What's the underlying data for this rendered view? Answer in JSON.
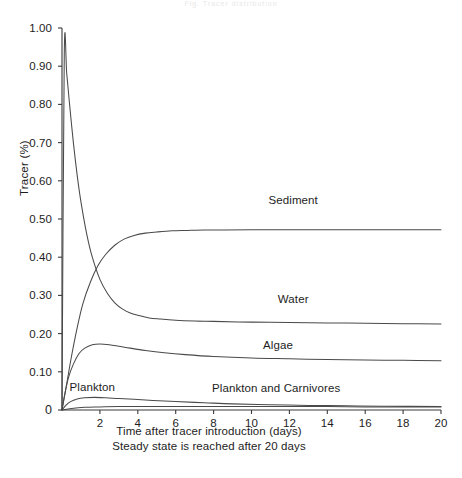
{
  "figure": {
    "top_faint_text": "Fig.   Tracer  distribution",
    "y_axis_title": "Tracer (%)",
    "x_caption_line1": "Time after tracer introduction (days)",
    "x_caption_line2": "Steady state is reached after 20 days"
  },
  "chart_data": {
    "type": "line",
    "title": "",
    "xlabel": "Time after tracer introduction (days)",
    "ylabel": "Tracer (%)",
    "xlim": [
      0,
      20
    ],
    "ylim": [
      0,
      1.0
    ],
    "grid": false,
    "legend": "inline-labels",
    "xticks": [
      0,
      2,
      4,
      6,
      8,
      10,
      12,
      14,
      16,
      18,
      20
    ],
    "xtick_labels": [
      "0",
      "2",
      "4",
      "6",
      "8",
      "10",
      "12",
      "14",
      "16",
      "18",
      "20"
    ],
    "yticks": [
      0,
      0.1,
      0.2,
      0.3,
      0.4,
      0.5,
      0.6,
      0.7,
      0.8,
      0.9,
      1.0
    ],
    "ytick_labels": [
      "0",
      "0.10",
      "0.20",
      "0.30",
      "0.40",
      "0.50",
      "0.60",
      "0.70",
      "0.80",
      "0.90",
      "1.00"
    ],
    "annotations": [
      {
        "text": "Sediment",
        "x": 12.2,
        "y": 0.545
      },
      {
        "text": "Water",
        "x": 12.2,
        "y": 0.285
      },
      {
        "text": "Algae",
        "x": 11.4,
        "y": 0.165
      },
      {
        "text": "Plankton",
        "x": 1.6,
        "y": 0.055
      },
      {
        "text": "Plankton and Carnivores",
        "x": 11.3,
        "y": 0.052
      }
    ],
    "series": [
      {
        "name": "Water",
        "color": "#4a4a4a",
        "x": [
          0,
          0.12,
          0.25,
          0.4,
          0.6,
          0.8,
          1.0,
          1.3,
          1.6,
          2.0,
          2.4,
          2.8,
          3.2,
          3.6,
          4.0,
          4.6,
          5.2,
          6.0,
          7.0,
          8.0,
          10.0,
          12.0,
          14.0,
          16.0,
          18.0,
          20.0
        ],
        "y": [
          0.0,
          0.93,
          0.88,
          0.8,
          0.7,
          0.615,
          0.545,
          0.462,
          0.4,
          0.342,
          0.305,
          0.28,
          0.264,
          0.254,
          0.248,
          0.241,
          0.238,
          0.235,
          0.233,
          0.232,
          0.23,
          0.229,
          0.228,
          0.227,
          0.226,
          0.225
        ]
      },
      {
        "name": "Sediment",
        "color": "#4a4a4a",
        "x": [
          0,
          0.2,
          0.5,
          0.8,
          1.1,
          1.5,
          1.9,
          2.3,
          2.8,
          3.3,
          3.8,
          4.4,
          5.0,
          5.8,
          6.6,
          7.5,
          8.5,
          10.0,
          12.0,
          14.0,
          16.0,
          18.0,
          20.0
        ],
        "y": [
          0.0,
          0.055,
          0.14,
          0.215,
          0.278,
          0.335,
          0.378,
          0.407,
          0.432,
          0.448,
          0.457,
          0.463,
          0.466,
          0.469,
          0.47,
          0.471,
          0.471,
          0.472,
          0.472,
          0.472,
          0.472,
          0.472,
          0.472
        ]
      },
      {
        "name": "Algae",
        "color": "#4a4a4a",
        "x": [
          0,
          0.15,
          0.35,
          0.6,
          0.9,
          1.2,
          1.6,
          2.0,
          2.5,
          3.0,
          3.6,
          4.4,
          5.4,
          6.5,
          8.0,
          10.0,
          12.0,
          14.0,
          16.0,
          18.0,
          20.0
        ],
        "y": [
          0.0,
          0.042,
          0.086,
          0.12,
          0.148,
          0.162,
          0.171,
          0.173,
          0.171,
          0.167,
          0.162,
          0.156,
          0.15,
          0.145,
          0.14,
          0.136,
          0.134,
          0.132,
          0.131,
          0.13,
          0.129
        ]
      },
      {
        "name": "Plankton",
        "color": "#4a4a4a",
        "x": [
          0,
          0.2,
          0.45,
          0.8,
          1.2,
          1.7,
          2.3,
          3.0,
          3.8,
          4.8,
          6.0,
          7.5,
          9.0,
          11.0,
          13.0,
          15.0,
          17.0,
          20.0
        ],
        "y": [
          0.0,
          0.012,
          0.022,
          0.029,
          0.032,
          0.033,
          0.032,
          0.03,
          0.028,
          0.025,
          0.022,
          0.019,
          0.016,
          0.014,
          0.012,
          0.011,
          0.01,
          0.009
        ]
      },
      {
        "name": "Plankton and Carnivores",
        "color": "#4a4a4a",
        "x": [
          0,
          0.5,
          1.2,
          2.0,
          3.0,
          4.5,
          6.0,
          8.0,
          10.0,
          12.0,
          14.0,
          16.0,
          18.0,
          20.0
        ],
        "y": [
          0.0,
          0.004,
          0.007,
          0.008,
          0.009,
          0.009,
          0.009,
          0.009,
          0.009,
          0.009,
          0.009,
          0.008,
          0.008,
          0.008
        ]
      }
    ]
  }
}
